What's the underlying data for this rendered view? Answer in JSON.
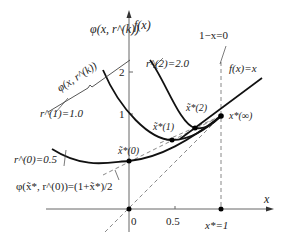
{
  "figure": {
    "title": "",
    "axes": {
      "y_label_left": "φ(x, r^(k))",
      "y_label_right": "f(x)",
      "x_label": "x",
      "x_ticks": [
        "0",
        "0.5",
        "x*=1"
      ],
      "y_ticks": [
        "1",
        "2"
      ]
    },
    "labels": {
      "brace_label": "φ(x, r^(k))",
      "r0": "r^(0)=0.5",
      "r1": "r^(1)=1.0",
      "r2": "r^(2)=2.0",
      "constraint": "1−x=0",
      "objective": "f(x)=x",
      "xstar0": "x̃*(0)",
      "xstar1": "x̃*(1)",
      "xstar2": "x̃*(2)",
      "xstarinf": "x*(∞)",
      "phi_eq": "φ(x̃*, r^(0))=(1+x̃*)/2"
    },
    "colors": {
      "curve": "#111111",
      "axis": "#555555",
      "dashed": "#777777"
    }
  }
}
